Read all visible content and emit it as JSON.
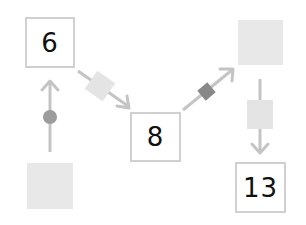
{
  "diagram": {
    "type": "number-machine-flow",
    "colors": {
      "arrow": "#c4c4c4",
      "box_border": "#d0d0d0",
      "blank": "#e8e8e8",
      "operator_light": "#e4e4e4",
      "operator_circle": "#9c9c9c",
      "operator_dark": "#888888",
      "text": "#111111"
    },
    "nodes": [
      {
        "id": "box-6",
        "value": "6",
        "blank": false
      },
      {
        "id": "blank-bottom-left",
        "value": "",
        "blank": true
      },
      {
        "id": "box-8",
        "value": "8",
        "blank": false
      },
      {
        "id": "blank-top-right",
        "value": "",
        "blank": true
      },
      {
        "id": "box-13",
        "value": "13",
        "blank": false
      }
    ],
    "edges": [
      {
        "from": "blank-bottom-left",
        "to": "box-6",
        "operator_shape": "circle",
        "operator_color": "#9c9c9c"
      },
      {
        "from": "box-6",
        "to": "box-8",
        "operator_shape": "diamond-square-light",
        "operator_color": "#e4e4e4"
      },
      {
        "from": "box-8",
        "to": "blank-top-right",
        "operator_shape": "diamond-square-dark",
        "operator_color": "#888888"
      },
      {
        "from": "blank-top-right",
        "to": "box-13",
        "operator_shape": "rectangle-light",
        "operator_color": "#e4e4e4"
      }
    ]
  }
}
